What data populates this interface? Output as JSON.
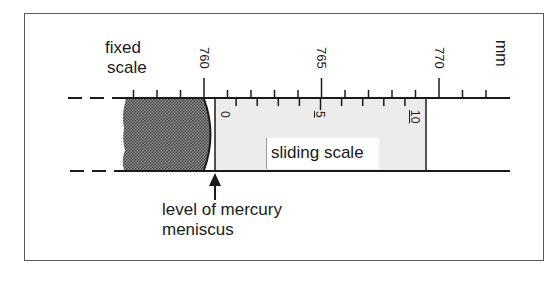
{
  "labels": {
    "fixed_scale_line1": "fixed",
    "fixed_scale_line2": "scale",
    "unit": "mm",
    "sliding_scale": "sliding scale",
    "meniscus_line1": "level of mercury",
    "meniscus_line2": "meniscus"
  },
  "fixed_scale": {
    "major_labels": [
      "760",
      "765",
      "770"
    ],
    "major_values": [
      760,
      765,
      770
    ],
    "range_mm": [
      757,
      772
    ]
  },
  "sliding_scale": {
    "labels": [
      "0",
      "5",
      "10"
    ],
    "divisions": 10,
    "zero_reading_mm": 760.5
  },
  "colors": {
    "line": "#1a1a1a",
    "mercury": "#6e6e6e",
    "sliding_fill": "#ececec",
    "frame": "#5a5a5a"
  }
}
